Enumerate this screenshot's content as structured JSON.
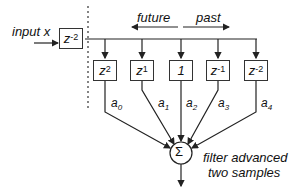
{
  "diagram": {
    "input_label": "input  x",
    "input_delay": {
      "base": "z",
      "exp": "-2"
    },
    "direction_labels": {
      "future": "future",
      "past": "past"
    },
    "taps": [
      {
        "base": "z",
        "exp": "2",
        "coef": "a",
        "coef_sub": "0"
      },
      {
        "base": "z",
        "exp": "1",
        "coef": "a",
        "coef_sub": "1"
      },
      {
        "base": "1",
        "exp": "",
        "coef": "a",
        "coef_sub": "2"
      },
      {
        "base": "z",
        "exp": "-1",
        "coef": "a",
        "coef_sub": "3"
      },
      {
        "base": "z",
        "exp": "-2",
        "coef": "a",
        "coef_sub": "4"
      }
    ],
    "summer_symbol": "Σ",
    "caption_line1": "filter advanced",
    "caption_line2": "two samples"
  }
}
